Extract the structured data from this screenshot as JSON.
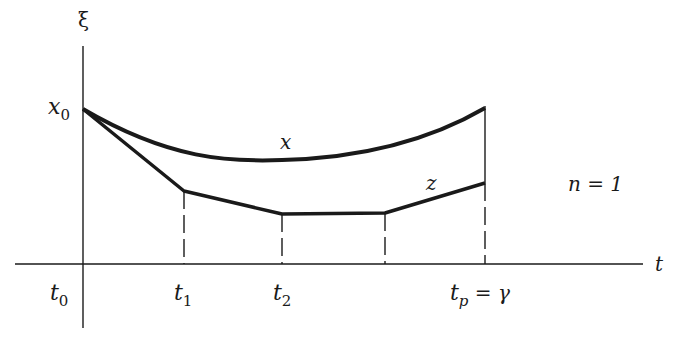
{
  "diagram": {
    "axes": {
      "vertical_label": "ξ",
      "horizontal_label": "t"
    },
    "labels": {
      "x0_main": "x",
      "x0_sub": "0",
      "t0_main": "t",
      "t0_sub": "0",
      "t1_main": "t",
      "t1_sub": "1",
      "t2_main": "t",
      "t2_sub": "2",
      "tp_main": "t",
      "tp_sub": "p",
      "tp_eq": " = γ",
      "curve_x": "x",
      "curve_z": "z",
      "n_label": "n = 1"
    },
    "colors": {
      "ink": "#1a1a1a",
      "background": "#ffffff"
    }
  }
}
